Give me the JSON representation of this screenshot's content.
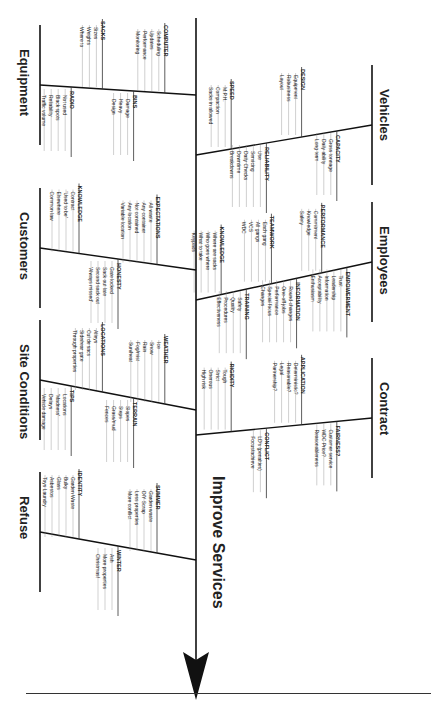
{
  "diagram": {
    "type": "fishbone",
    "effect": "Improve Services",
    "colors": {
      "line": "#111111",
      "text": "#222222",
      "background": "#ffffff"
    },
    "categories": [
      {
        "name": "Vehicles",
        "side": "right",
        "causes": [
          {
            "title": "SPEED",
            "items": [
              "M.P.H.",
              "Compaction",
              "Sacks in allowed"
            ]
          },
          {
            "title": "RELIABILITY",
            "items": [
              "Use",
              "Servicing",
              "Daily Checks",
              "Downtime",
              "Breakdowns"
            ]
          },
          {
            "title": "DESIGN",
            "items": [
              "Equipment",
              "Robustness",
              "Layout"
            ]
          },
          {
            "title": "CAPACITY",
            "items": [
              "Gross tonnage",
              "Daily ability",
              "Long term"
            ]
          }
        ]
      },
      {
        "name": "Employees",
        "side": "right",
        "causes": [
          {
            "title": "KNOWLEDGE",
            "items": [
              "Where are sacks",
              "Who goes where",
              "What to take",
              "Keypads"
            ]
          },
          {
            "title": "TRAINING",
            "items": [
              "Safety",
              "Quality",
              "Procedures",
              "Effectiveness"
            ]
          },
          {
            "title": "TEAMWORK",
            "items": [
              "Each gang",
              "All gangs",
              "VCS",
              "WDC"
            ]
          },
          {
            "title": "INFORMATION",
            "items": [
              "Round changes",
              "One-off jobs",
              "Performance",
              "Special focus",
              "Changes"
            ]
          },
          {
            "title": "PERFORMANCE",
            "items": [
              "Commitment",
              "Knowledge",
              "Safety"
            ]
          },
          {
            "title": "EMPOWERMENT",
            "items": [
              "Trust",
              "Leadership",
              "Information",
              "Acceptability",
              "Enthusiasm"
            ]
          }
        ]
      },
      {
        "name": "Contract",
        "side": "right",
        "causes": [
          {
            "title": "RIGIDITY",
            "items": [
              "Tough",
              "Strict",
              "Onerous",
              "High risk"
            ]
          },
          {
            "title": "CONFLICT",
            "items": [
              "LD's (penalties)",
              "Focus/achieve"
            ]
          },
          {
            "title": "APPLICATION",
            "items": [
              "Deterministic?",
              "Reasonable?",
              "Legal",
              "Partnership?"
            ]
          },
          {
            "title": "FAIRNESS?",
            "items": [
              "Customer service",
              "WDC Price?",
              "Reasonableness"
            ]
          }
        ]
      },
      {
        "name": "Equipment",
        "side": "left",
        "causes": [
          {
            "title": "COMPUTER",
            "items": [
              "Scheduling",
              "Updates",
              "Performance",
              "Monitoring"
            ]
          },
          {
            "title": "BINS",
            "items": [
              "Damage",
              "Heavy",
              "Design"
            ]
          },
          {
            "title": "SACKS",
            "items": [
              "Sizes",
              "Weights",
              "Where to"
            ]
          },
          {
            "title": "RADIO",
            "items": [
              "Not used",
              "Black spots",
              "Reliability",
              "Traffic volume"
            ]
          }
        ]
      },
      {
        "name": "Customers",
        "side": "left",
        "causes": [
          {
            "title": "EXPECTATIONS",
            "items": [
              "All waste",
              "Any container",
              "Not contained",
              "Any location",
              "Variable location"
            ]
          },
          {
            "title": "HONESTY",
            "items": [
              "Gate locked",
              "Sack out late",
              "Second sack out",
              "'Always missed'"
            ]
          },
          {
            "title": "KNOWLEDGE",
            "items": [
              "Contract",
              "'Used to be'",
              "Elsewhere",
              "Common law"
            ]
          }
        ]
      },
      {
        "name": "Site Conditions",
        "side": "left",
        "causes": [
          {
            "title": "WEATHER",
            "items": [
              "Ice",
              "Snow",
              "Rain",
              "Fog/mist",
              "Sun/heat"
            ]
          },
          {
            "title": "TERRAIN",
            "items": [
              "Slopes",
              "Steps",
              "Grass/mud",
              "Fences"
            ]
          },
          {
            "title": "LOCATIONS",
            "items": [
              "Alleys",
              "Cul de sacs",
              "Side/rear gate",
              "Through properties"
            ]
          },
          {
            "title": "TIPS",
            "items": [
              "Locations",
              "'Madness'",
              "Delays",
              "Vehicle damage"
            ]
          }
        ]
      },
      {
        "name": "Refuse",
        "side": "left",
        "causes": [
          {
            "title": "SUMMER",
            "items": [
              "Garden waste",
              "DIY Scrap",
              "Less properties",
              "More conflict"
            ]
          },
          {
            "title": "WINTER",
            "items": [
              "Ash",
              "More properties",
              "Christmas!"
            ]
          },
          {
            "title": "IDENTITY",
            "items": [
              "Garden Waste",
              "Bulky",
              "Glass",
              "Asbestos",
              "Toys Laundry"
            ]
          }
        ]
      }
    ]
  }
}
